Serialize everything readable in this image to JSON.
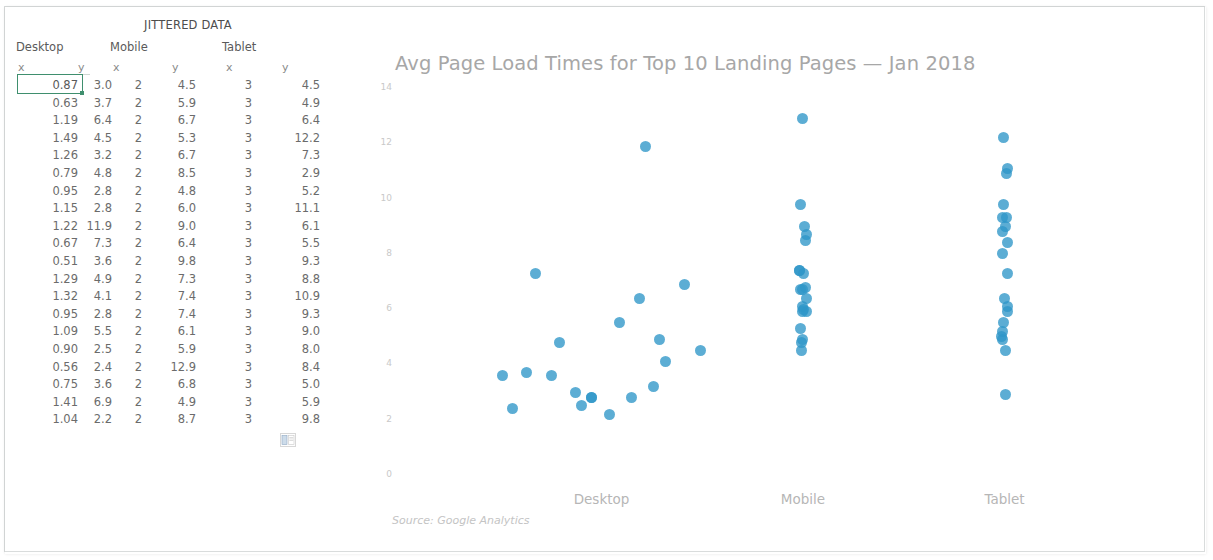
{
  "spreadsheet": {
    "title": "JITTERED DATA",
    "groups": [
      {
        "name": "Desktop"
      },
      {
        "name": "Mobile"
      },
      {
        "name": "Tablet"
      }
    ],
    "column_headers": [
      "x",
      "y",
      "x",
      "y",
      "x",
      "y"
    ],
    "selected_cell_value": "0.87",
    "paste_options_icon": "paste-options-icon",
    "rows": [
      {
        "dx": "0.87",
        "dy": "3.0",
        "mx": "2",
        "my": "4.5",
        "tx": "3",
        "ty": "4.5"
      },
      {
        "dx": "0.63",
        "dy": "3.7",
        "mx": "2",
        "my": "5.9",
        "tx": "3",
        "ty": "4.9"
      },
      {
        "dx": "1.19",
        "dy": "6.4",
        "mx": "2",
        "my": "6.7",
        "tx": "3",
        "ty": "6.4"
      },
      {
        "dx": "1.49",
        "dy": "4.5",
        "mx": "2",
        "my": "5.3",
        "tx": "3",
        "ty": "12.2"
      },
      {
        "dx": "1.26",
        "dy": "3.2",
        "mx": "2",
        "my": "6.7",
        "tx": "3",
        "ty": "7.3"
      },
      {
        "dx": "0.79",
        "dy": "4.8",
        "mx": "2",
        "my": "8.5",
        "tx": "3",
        "ty": "2.9"
      },
      {
        "dx": "0.95",
        "dy": "2.8",
        "mx": "2",
        "my": "4.8",
        "tx": "3",
        "ty": "5.2"
      },
      {
        "dx": "1.15",
        "dy": "2.8",
        "mx": "2",
        "my": "6.0",
        "tx": "3",
        "ty": "11.1"
      },
      {
        "dx": "1.22",
        "dy": "11.9",
        "mx": "2",
        "my": "9.0",
        "tx": "3",
        "ty": "6.1"
      },
      {
        "dx": "0.67",
        "dy": "7.3",
        "mx": "2",
        "my": "6.4",
        "tx": "3",
        "ty": "5.5"
      },
      {
        "dx": "0.51",
        "dy": "3.6",
        "mx": "2",
        "my": "9.8",
        "tx": "3",
        "ty": "9.3"
      },
      {
        "dx": "1.29",
        "dy": "4.9",
        "mx": "2",
        "my": "7.3",
        "tx": "3",
        "ty": "8.8"
      },
      {
        "dx": "1.32",
        "dy": "4.1",
        "mx": "2",
        "my": "7.4",
        "tx": "3",
        "ty": "10.9"
      },
      {
        "dx": "0.95",
        "dy": "2.8",
        "mx": "2",
        "my": "7.4",
        "tx": "3",
        "ty": "9.3"
      },
      {
        "dx": "1.09",
        "dy": "5.5",
        "mx": "2",
        "my": "6.1",
        "tx": "3",
        "ty": "9.0"
      },
      {
        "dx": "0.90",
        "dy": "2.5",
        "mx": "2",
        "my": "5.9",
        "tx": "3",
        "ty": "8.0"
      },
      {
        "dx": "0.56",
        "dy": "2.4",
        "mx": "2",
        "my": "12.9",
        "tx": "3",
        "ty": "8.4"
      },
      {
        "dx": "0.75",
        "dy": "3.6",
        "mx": "2",
        "my": "6.8",
        "tx": "3",
        "ty": "5.0"
      },
      {
        "dx": "1.41",
        "dy": "6.9",
        "mx": "2",
        "my": "4.9",
        "tx": "3",
        "ty": "5.9"
      },
      {
        "dx": "1.04",
        "dy": "2.2",
        "mx": "2",
        "my": "8.7",
        "tx": "3",
        "ty": "9.8"
      }
    ]
  },
  "chart": {
    "title": "Avg Page Load Times for Top 10 Landing Pages — Jan 2018",
    "source": "Source: Google Analytics",
    "dot_color": "#2e96c8",
    "title_color": "#a7a7a7"
  },
  "chart_data": {
    "type": "scatter",
    "title": "Avg Page Load Times for Top 10 Landing Pages — Jan 2018",
    "subtitle": "",
    "xlabel": "",
    "ylabel": "",
    "annotations": [
      "Source: Google Analytics"
    ],
    "grid": false,
    "legend": "none",
    "xlim": [
      0,
      4
    ],
    "ylim": [
      0,
      14
    ],
    "yticks": [
      0,
      2,
      4,
      6,
      8,
      10,
      12,
      14
    ],
    "xticks": [
      1,
      2,
      3
    ],
    "xticklabels": [
      "Desktop",
      "Mobile",
      "Tablet"
    ],
    "series": [
      {
        "name": "Desktop",
        "x": [
          0.87,
          0.63,
          1.19,
          1.49,
          1.26,
          0.79,
          0.95,
          1.15,
          1.22,
          0.67,
          0.51,
          1.29,
          1.32,
          0.95,
          1.09,
          0.9,
          0.56,
          0.75,
          1.41,
          1.04
        ],
        "y": [
          3.0,
          3.7,
          6.4,
          4.5,
          3.2,
          4.8,
          2.8,
          2.8,
          11.9,
          7.3,
          3.6,
          4.9,
          4.1,
          2.8,
          5.5,
          2.5,
          2.4,
          3.6,
          6.9,
          2.2
        ]
      },
      {
        "name": "Mobile",
        "x": [
          2,
          2,
          2,
          2,
          2,
          2,
          2,
          2,
          2,
          2,
          2,
          2,
          2,
          2,
          2,
          2,
          2,
          2,
          2,
          2
        ],
        "y": [
          4.5,
          5.9,
          6.7,
          5.3,
          6.7,
          8.5,
          4.8,
          6.0,
          9.0,
          6.4,
          9.8,
          7.3,
          7.4,
          7.4,
          6.1,
          5.9,
          12.9,
          6.8,
          4.9,
          8.7
        ]
      },
      {
        "name": "Tablet",
        "x": [
          3,
          3,
          3,
          3,
          3,
          3,
          3,
          3,
          3,
          3,
          3,
          3,
          3,
          3,
          3,
          3,
          3,
          3,
          3,
          3
        ],
        "y": [
          4.5,
          4.9,
          6.4,
          12.2,
          7.3,
          2.9,
          5.2,
          11.1,
          6.1,
          5.5,
          9.3,
          8.8,
          10.9,
          9.3,
          9.0,
          8.0,
          8.4,
          5.0,
          5.9,
          9.8
        ]
      }
    ]
  }
}
